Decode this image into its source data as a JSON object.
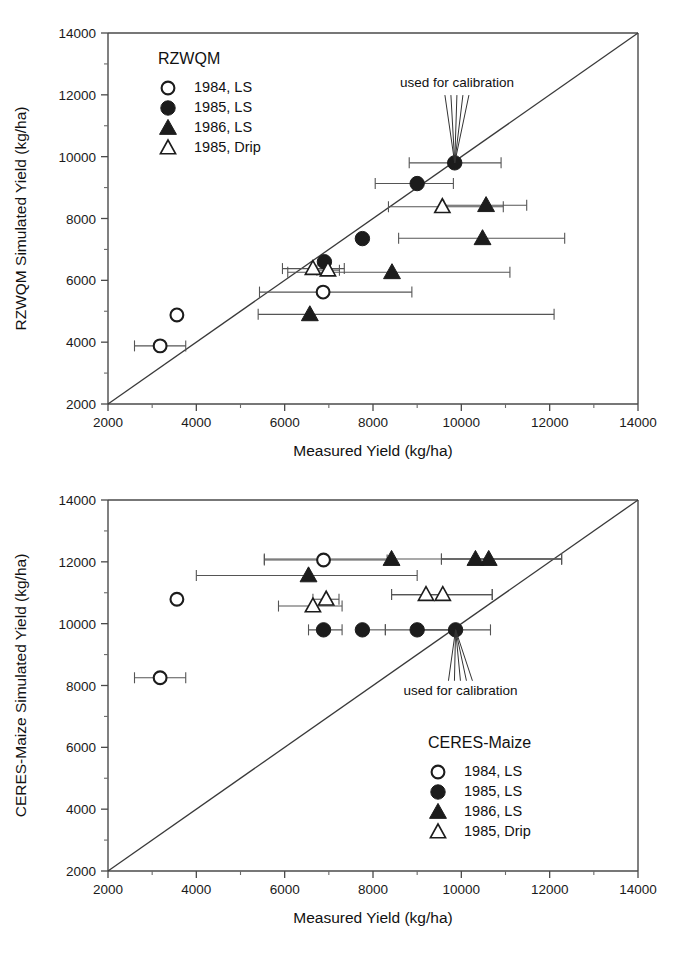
{
  "figure": {
    "panel_count": 2,
    "marker_shapes": {
      "open-circle": "○",
      "filled-circle": "●",
      "filled-triangle": "▲",
      "open-triangle": "△"
    }
  },
  "chart_data": [
    {
      "type": "scatter",
      "id": "rzwqm",
      "title": "RZWQM",
      "xlabel": "Measured Yield (kg/ha)",
      "ylabel": "RZWQM Simulated Yield (kg/ha)",
      "xlim": [
        2000,
        14000
      ],
      "ylim": [
        2000,
        14000
      ],
      "xticks": [
        2000,
        4000,
        6000,
        8000,
        10000,
        12000,
        14000
      ],
      "yticks": [
        2000,
        4000,
        6000,
        8000,
        10000,
        12000,
        14000
      ],
      "xticklabels": [
        "2000",
        "4000",
        "6000",
        "8000",
        "10000",
        "12000",
        "14000"
      ],
      "yticklabels": [
        "2000",
        "4000",
        "6000",
        "8000",
        "10000",
        "12000",
        "14000"
      ],
      "grid": false,
      "legend_position": "top-left",
      "reference_line": {
        "label": "1:1 line",
        "from": [
          2000,
          2000
        ],
        "to": [
          14000,
          14000
        ]
      },
      "annotations": [
        {
          "text": "used for calibration",
          "x": 9850,
          "y": 9800,
          "text_x": 9900,
          "text_y": 12250
        }
      ],
      "series": [
        {
          "name": "1984, LS",
          "marker": "open-circle",
          "points": [
            {
              "x": 3560,
              "y": 4880,
              "xerr_low": 3560,
              "xerr_high": 3560
            },
            {
              "x": 3180,
              "y": 3880,
              "xerr_low": 2600,
              "xerr_high": 3760
            },
            {
              "x": 6870,
              "y": 5620,
              "xerr_low": 5430,
              "xerr_high": 8880
            }
          ]
        },
        {
          "name": "1985, LS",
          "marker": "filled-circle",
          "points": [
            {
              "x": 9850,
              "y": 9800,
              "xerr_low": 8820,
              "xerr_high": 10900
            },
            {
              "x": 9000,
              "y": 9130,
              "xerr_low": 8050,
              "xerr_high": 9820
            },
            {
              "x": 7760,
              "y": 7350,
              "xerr_low": 7760,
              "xerr_high": 7760
            },
            {
              "x": 6900,
              "y": 6600,
              "xerr_low": 6900,
              "xerr_high": 6900
            }
          ]
        },
        {
          "name": "1986, LS",
          "marker": "filled-triangle",
          "points": [
            {
              "x": 10560,
              "y": 8430,
              "xerr_low": 9600,
              "xerr_high": 11480
            },
            {
              "x": 10480,
              "y": 7360,
              "xerr_low": 8580,
              "xerr_high": 12340
            },
            {
              "x": 8430,
              "y": 6260,
              "xerr_low": 6070,
              "xerr_high": 11100
            },
            {
              "x": 6570,
              "y": 4900,
              "xerr_low": 5400,
              "xerr_high": 12100
            }
          ]
        },
        {
          "name": "1985, Drip",
          "marker": "open-triangle",
          "points": [
            {
              "x": 9570,
              "y": 8380,
              "xerr_low": 8350,
              "xerr_high": 10950
            },
            {
              "x": 6640,
              "y": 6380,
              "xerr_low": 5950,
              "xerr_high": 7350
            },
            {
              "x": 6980,
              "y": 6330,
              "xerr_low": 6730,
              "xerr_high": 7240
            }
          ]
        }
      ]
    },
    {
      "type": "scatter",
      "id": "ceres-maize",
      "title": "CERES-Maize",
      "xlabel": "Measured Yield (kg/ha)",
      "ylabel": "CERES-Maize Simulated Yield (kg/ha)",
      "xlim": [
        2000,
        14000
      ],
      "ylim": [
        2000,
        14000
      ],
      "xticks": [
        2000,
        4000,
        6000,
        8000,
        10000,
        12000,
        14000
      ],
      "yticks": [
        2000,
        4000,
        6000,
        8000,
        10000,
        12000,
        14000
      ],
      "xticklabels": [
        "2000",
        "4000",
        "6000",
        "8000",
        "10000",
        "12000",
        "14000"
      ],
      "yticklabels": [
        "2000",
        "4000",
        "6000",
        "8000",
        "10000",
        "12000",
        "14000"
      ],
      "grid": false,
      "legend_position": "bottom-right",
      "reference_line": {
        "label": "1:1 line",
        "from": [
          2000,
          2000
        ],
        "to": [
          14000,
          14000
        ]
      },
      "annotations": [
        {
          "text": "used for calibration",
          "x": 9870,
          "y": 9800,
          "text_x": 9980,
          "text_y": 7700
        }
      ],
      "series": [
        {
          "name": "1984, LS",
          "marker": "open-circle",
          "points": [
            {
              "x": 6880,
              "y": 12060,
              "xerr_low": 5540,
              "xerr_high": 8320
            },
            {
              "x": 3560,
              "y": 10790,
              "xerr_low": 3560,
              "xerr_high": 3560
            },
            {
              "x": 3180,
              "y": 8250,
              "xerr_low": 2600,
              "xerr_high": 3760
            }
          ]
        },
        {
          "name": "1985, LS",
          "marker": "filled-circle",
          "points": [
            {
              "x": 9870,
              "y": 9800,
              "xerr_low": 9000,
              "xerr_high": 10660
            },
            {
              "x": 9000,
              "y": 9800,
              "xerr_low": 8280,
              "xerr_high": 9870
            },
            {
              "x": 7760,
              "y": 9800,
              "xerr_low": 7760,
              "xerr_high": 8280
            },
            {
              "x": 6880,
              "y": 9800,
              "xerr_low": 6540,
              "xerr_high": 7300
            }
          ]
        },
        {
          "name": "1986, LS",
          "marker": "filled-triangle",
          "points": [
            {
              "x": 10620,
              "y": 12090,
              "xerr_low": 9550,
              "xerr_high": 12270
            },
            {
              "x": 10320,
              "y": 12090,
              "xerr_low": 9550,
              "xerr_high": 12270
            },
            {
              "x": 8420,
              "y": 12090,
              "xerr_low": 5540,
              "xerr_high": 12270
            },
            {
              "x": 6540,
              "y": 11560,
              "xerr_low": 4000,
              "xerr_high": 9000
            }
          ]
        },
        {
          "name": "1985, Drip",
          "marker": "open-triangle",
          "points": [
            {
              "x": 9580,
              "y": 10940,
              "xerr_low": 8420,
              "xerr_high": 10700
            },
            {
              "x": 9200,
              "y": 10940,
              "xerr_low": 8420,
              "xerr_high": 10700
            },
            {
              "x": 6940,
              "y": 10790,
              "xerr_low": 6640,
              "xerr_high": 7230
            },
            {
              "x": 6640,
              "y": 10570,
              "xerr_low": 5860,
              "xerr_high": 7300
            }
          ]
        }
      ]
    }
  ]
}
